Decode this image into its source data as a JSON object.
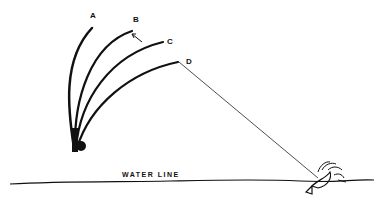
{
  "diagram": {
    "rod_positions": [
      {
        "label": "A"
      },
      {
        "label": "B"
      },
      {
        "label": "C"
      },
      {
        "label": "D"
      }
    ],
    "water_label": "WATER LINE",
    "colors": {
      "ink": "#111111",
      "background": "#ffffff"
    }
  }
}
